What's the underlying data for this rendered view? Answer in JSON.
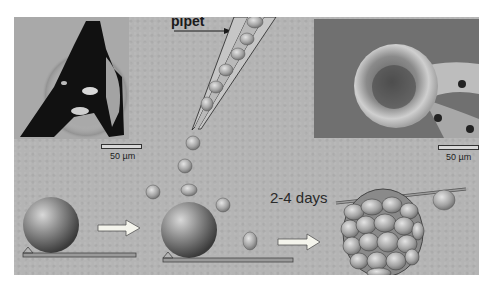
{
  "figure": {
    "labels": {
      "pipet": "pipet",
      "duration": "2-4 days"
    },
    "micrographs": [
      {
        "id": "light-micrograph",
        "description": "light microscopy of cell-covered microcarrier held by pipette",
        "scale_bar": "50 µm"
      },
      {
        "id": "sem-micrograph",
        "description": "scanning electron micrograph of cell aggregate",
        "scale_bar": "50 µm"
      }
    ],
    "steps": [
      {
        "id": "step-1",
        "description": "microcarrier bead resting on substrate"
      },
      {
        "id": "step-2",
        "description": "cells dispensed from pipet onto bead"
      },
      {
        "id": "step-3",
        "description": "cell aggregate formed after incubation"
      }
    ],
    "colors": {
      "background": "#b4b4b4",
      "arrow_fill": "#f4f4ec",
      "outline": "#333333"
    }
  }
}
